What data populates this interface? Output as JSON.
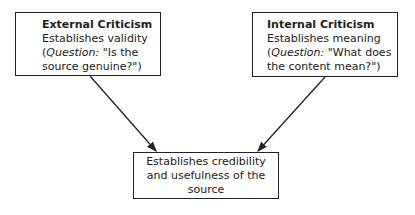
{
  "diagram": {
    "left_box": {
      "title": "External Criticism",
      "line1": "Establishes validity",
      "q_prefix": "(",
      "q_label": "Question:",
      "q_rest1": " \"Is the",
      "line4": "source genuine?\")"
    },
    "right_box": {
      "title": "Internal Criticism",
      "line1": "Establishes meaning",
      "q_prefix": "(",
      "q_label": "Question:",
      "q_rest1": " \"What does",
      "line4": "the content mean?\")"
    },
    "bottom_box": {
      "line1": "Establishes credibility",
      "line2": "and usefulness of the",
      "line3": "source"
    },
    "edges": [
      {
        "from": "left_box",
        "to": "bottom_box"
      },
      {
        "from": "right_box",
        "to": "bottom_box"
      }
    ]
  }
}
